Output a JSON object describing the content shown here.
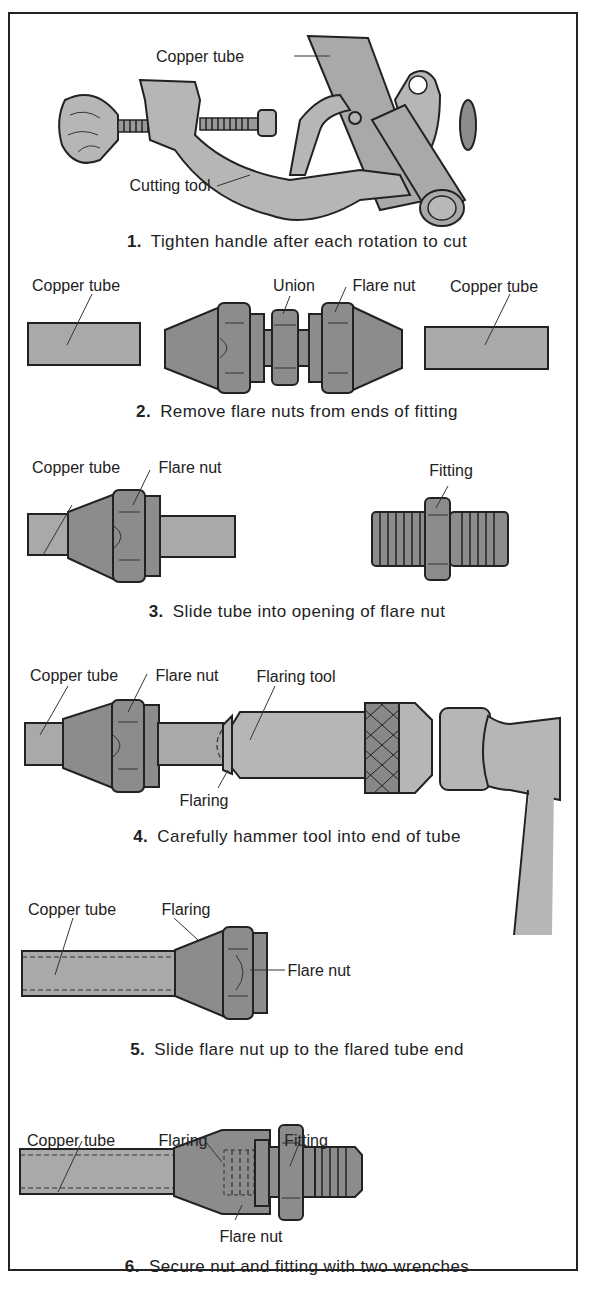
{
  "figure": {
    "colors": {
      "metal_dark": "#8c8c8c",
      "tube": "#a9a9a9",
      "outline": "#222222",
      "background": "#ffffff"
    }
  },
  "steps": [
    {
      "number": "1.",
      "caption": "Tighten handle after each rotation to cut",
      "labels": [
        "Copper tube",
        "Cutting tool"
      ]
    },
    {
      "number": "2.",
      "caption": "Remove flare nuts from ends of fitting",
      "labels": [
        "Copper tube",
        "Union",
        "Flare nut",
        "Copper tube"
      ]
    },
    {
      "number": "3.",
      "caption": "Slide tube into opening of flare nut",
      "labels": [
        "Copper tube",
        "Flare nut",
        "Fitting"
      ]
    },
    {
      "number": "4.",
      "caption": "Carefully hammer tool into end of tube",
      "labels": [
        "Copper tube",
        "Flare nut",
        "Flaring tool",
        "Flaring"
      ]
    },
    {
      "number": "5.",
      "caption": "Slide flare nut up to the flared tube end",
      "labels": [
        "Copper tube",
        "Flaring",
        "Flare nut"
      ]
    },
    {
      "number": "6.",
      "caption": "Secure nut and fitting with two wrenches",
      "labels": [
        "Copper tube",
        "Flaring",
        "Fitting",
        "Flare nut"
      ]
    }
  ]
}
